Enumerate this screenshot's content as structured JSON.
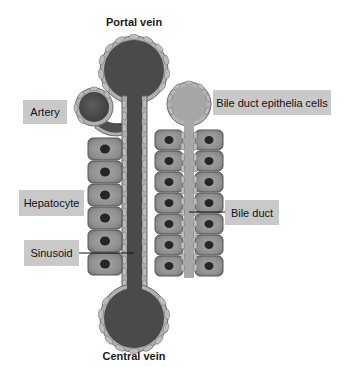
{
  "diagram": {
    "titles": {
      "top": "Portal vein",
      "bottom": "Central vein"
    },
    "labels": {
      "artery": "Artery",
      "bile_duct_epithelia": "Bile duct epithelia cells",
      "hepatocyte": "Hepatocyte",
      "sinusoid": "Sinusoid",
      "bile_duct": "Bile duct"
    },
    "colors": {
      "vein_fill": "#4a4a4a",
      "artery_fill": "#505050",
      "bile_fill": "#a8a8a8",
      "endothelial_cell": "#b8b8b8",
      "hepatocyte_fill": "#8c8c8c",
      "nucleus": "#262626",
      "label_bg": "#c9c9c9"
    }
  }
}
